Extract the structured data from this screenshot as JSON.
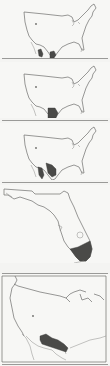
{
  "figure": {
    "type": "species-range-maps",
    "panel_count": 5,
    "colors": {
      "background": "#f7f7f5",
      "outline": "#6d6d6b",
      "range_fill": "#4a4a48",
      "separator": "#9a9a98"
    },
    "panels": [
      {
        "id": 1,
        "region": "Continental United States",
        "range_description": "Southern Arizona / Baja California and south Texas border into Mexico"
      },
      {
        "id": 2,
        "region": "Continental United States",
        "range_description": "South Texas / northeastern Mexico"
      },
      {
        "id": 3,
        "region": "Continental United States",
        "range_description": "Southern Arizona, Baja California and south Texas into Mexico"
      },
      {
        "id": 4,
        "region": "Florida",
        "range_description": "Southern tip of Florida peninsula"
      },
      {
        "id": 5,
        "region": "Southwestern United States",
        "range_description": "Southern New Mexico and west Texas band"
      }
    ]
  }
}
